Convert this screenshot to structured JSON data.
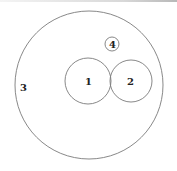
{
  "diagram": {
    "type": "venn-circles",
    "circles": [
      {
        "id": "1",
        "label": "1",
        "cx": 88,
        "cy": 81,
        "r": 23
      },
      {
        "id": "2",
        "label": "2",
        "cx": 131,
        "cy": 81,
        "r": 21
      },
      {
        "id": "3",
        "label": "3",
        "cx": 89,
        "cy": 85,
        "r": 74
      },
      {
        "id": "4",
        "label": "4",
        "cx": 112,
        "cy": 44,
        "r": 7
      }
    ],
    "stroke_color": "#7a7a7a",
    "background": "#ffffff"
  }
}
